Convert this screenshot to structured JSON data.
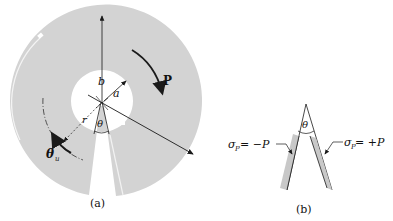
{
  "figure_a": {
    "caption": "(a)",
    "labels": {
      "b": "b",
      "a": "a",
      "theta": "θ",
      "r": "r",
      "theta_u": "θ",
      "theta_u_sub": "u",
      "P": "P"
    }
  },
  "figure_b": {
    "caption": "(b)",
    "theta": "θ",
    "left_label": {
      "sigma": "σ",
      "sub": "P",
      "rest": " = −P"
    },
    "right_label": {
      "sigma": "σ",
      "sub": "P",
      "rest": " = +P"
    }
  },
  "colors": {
    "disk_fill": "#d2d2d2",
    "strip_fill": "#c8c8c8",
    "line": "#1a1a1a"
  }
}
